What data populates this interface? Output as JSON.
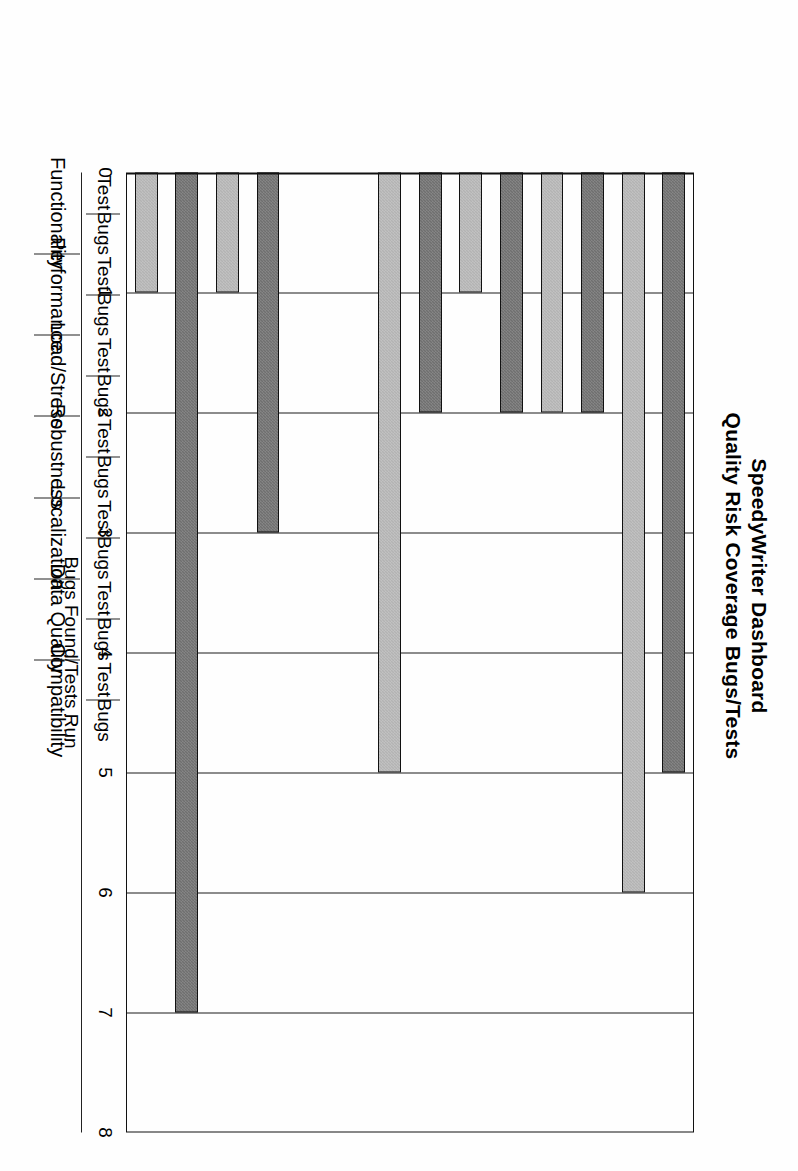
{
  "title": {
    "line1": "SpeedyWriter Dashboard",
    "line2": "Quality Risk Coverage Bugs/Tests"
  },
  "axes": {
    "value_axis_title": "Bugs Found/Tests Run",
    "value_ticks": [
      "8",
      "7",
      "6",
      "5",
      "4",
      "3",
      "2",
      "1",
      "0"
    ],
    "category_sublabels": [
      "Test",
      "Bugs"
    ],
    "categories": [
      "Functionality",
      "Performance",
      "Load/Stress",
      "Robustness",
      "Localization",
      "Data Quality",
      "Compatibility"
    ]
  },
  "colors": {
    "test_bar": "#6f6f6f",
    "bugs_bar": "#b3b3b3",
    "axis": "#111111",
    "background": "#fefefe"
  },
  "chart_data": {
    "type": "bar",
    "title": "SpeedyWriter Dashboard\nQuality Risk Coverage Bugs/Tests",
    "orientation": "vertical",
    "xlabel": "",
    "ylabel": "Bugs Found/Tests Run",
    "ylim": [
      0,
      8
    ],
    "ytick_values": [
      0,
      1,
      2,
      3,
      4,
      5,
      6,
      7,
      8
    ],
    "grid": true,
    "legend": "none",
    "categories": [
      "Functionality",
      "Performance",
      "Load/Stress",
      "Robustness",
      "Localization",
      "Data Quality",
      "Compatibility"
    ],
    "subcategories": [
      "Test",
      "Bugs"
    ],
    "series": [
      {
        "name": "Test",
        "values": [
          5,
          2,
          2,
          2,
          0,
          3,
          7
        ]
      },
      {
        "name": "Bugs",
        "values": [
          6,
          2,
          1,
          5,
          0,
          1,
          1
        ]
      }
    ],
    "points": [
      {
        "category": "Functionality",
        "sub": "Test",
        "value": 5
      },
      {
        "category": "Functionality",
        "sub": "Bugs",
        "value": 6
      },
      {
        "category": "Performance",
        "sub": "Test",
        "value": 2
      },
      {
        "category": "Performance",
        "sub": "Bugs",
        "value": 2
      },
      {
        "category": "Load/Stress",
        "sub": "Test",
        "value": 2
      },
      {
        "category": "Load/Stress",
        "sub": "Bugs",
        "value": 1
      },
      {
        "category": "Robustness",
        "sub": "Test",
        "value": 2
      },
      {
        "category": "Robustness",
        "sub": "Bugs",
        "value": 5
      },
      {
        "category": "Localization",
        "sub": "Test",
        "value": 0
      },
      {
        "category": "Localization",
        "sub": "Bugs",
        "value": 0
      },
      {
        "category": "Data Quality",
        "sub": "Test",
        "value": 3
      },
      {
        "category": "Data Quality",
        "sub": "Bugs",
        "value": 1
      },
      {
        "category": "Compatibility",
        "sub": "Test",
        "value": 7
      },
      {
        "category": "Compatibility",
        "sub": "Bugs",
        "value": 1
      }
    ]
  }
}
